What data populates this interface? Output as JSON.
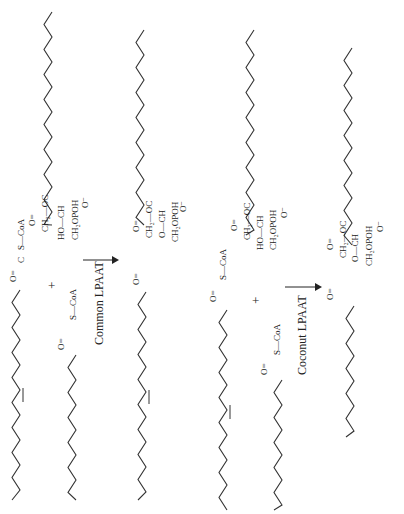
{
  "diagram": {
    "title": "",
    "orientation": "rotated-90-ccw",
    "panels": [
      {
        "name": "common-lpaat",
        "enzyme_label": "Common LPAAT",
        "reactants": [
          {
            "name": "oleoyl-coa",
            "label": "S—CoA",
            "carbonyl": "O",
            "chain": "C18:1"
          },
          {
            "name": "lysophosphatidic-acid",
            "labels": [
              "CH2—OC",
              "HO—CH",
              "CH2OPOH",
              "O-"
            ]
          },
          {
            "name": "acyl-coa-2",
            "label": "S—CoA",
            "carbonyl": "O",
            "chain": "C18:1"
          }
        ],
        "plus": "+",
        "product": {
          "name": "phosphatidic-acid",
          "labels": [
            "CH2—OC",
            "O—CH",
            "CH2OPOH",
            "O-"
          ]
        }
      },
      {
        "name": "coconut-lpaat",
        "enzyme_label": "Coconut LPAAT",
        "reactants": [
          {
            "name": "oleoyl-coa",
            "label": "S—CoA",
            "carbonyl": "O",
            "chain": "C18:1"
          },
          {
            "name": "lysophosphatidic-acid",
            "labels": [
              "CH2—OC",
              "HO—CH",
              "CH2OPOH",
              "O-"
            ]
          },
          {
            "name": "lauroyl-coa",
            "label": "S—CoA",
            "carbonyl": "O",
            "chain": "C12:0"
          }
        ],
        "plus": "+",
        "product": {
          "name": "phosphatidic-acid-medium-chain",
          "labels": [
            "CH2—OC",
            "O—CH",
            "CH2OPOH",
            "O-"
          ]
        }
      }
    ],
    "text": {
      "common": "Common LPAAT",
      "coconut": "Coconut LPAAT",
      "plus": "+",
      "scoa": "S—CoA",
      "o": "O",
      "c": "C",
      "ch2oc": "CH₂—OC",
      "ho_ch": "HO—CH",
      "o_ch": "O—CH",
      "ch2opoh": "CH₂OPOH",
      "ominus": "O⁻",
      "dbl": "O=",
      "oc": "O—"
    },
    "colors": {
      "line": "#333333",
      "background": "#ffffff"
    }
  }
}
